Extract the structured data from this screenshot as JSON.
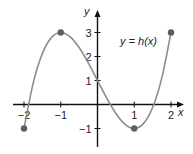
{
  "chart_data": {
    "type": "line",
    "title": "",
    "annotation": "y = h(x)",
    "xlabel": "x",
    "ylabel": "y",
    "xlim": [
      -2,
      2
    ],
    "ylim": [
      -1,
      3
    ],
    "grid": false,
    "x_ticks": [
      -2,
      -1,
      1,
      2
    ],
    "x_tick_labels": [
      "−2",
      "−1",
      "1",
      "2"
    ],
    "y_ticks": [
      3,
      2,
      1,
      -1
    ],
    "y_tick_labels": [
      "3",
      "2",
      "1",
      "−1"
    ],
    "series": [
      {
        "name": "y = h(x)",
        "x": [
          -2,
          -1.75,
          -1.5,
          -1.25,
          -1,
          -0.75,
          -0.5,
          -0.25,
          0,
          0.25,
          0.5,
          0.75,
          1,
          1.25,
          1.5,
          1.75,
          2
        ],
        "y": [
          -1,
          0.891,
          2.125,
          2.797,
          3,
          2.828,
          2.375,
          1.734,
          1,
          0.266,
          -0.375,
          -0.828,
          -1,
          -0.797,
          -0.125,
          1.109,
          3
        ]
      }
    ],
    "marked_points": [
      {
        "x": -2,
        "y": -1
      },
      {
        "x": -1,
        "y": 3
      },
      {
        "x": 1,
        "y": -1
      },
      {
        "x": 2,
        "y": 3
      }
    ]
  },
  "colors": {
    "curve": "#8c8c8c",
    "points": "#5e5e5e",
    "axis": "#111111"
  }
}
